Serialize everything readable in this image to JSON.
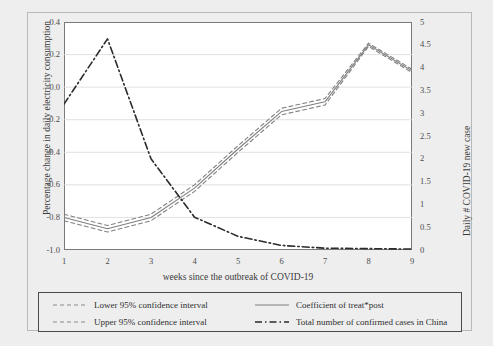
{
  "chart_data": {
    "type": "line",
    "title": "",
    "xlabel": "weeks since the outbreak of COVID-19",
    "ylabel": "Percentage change in daily electricity consumption",
    "y2label": "Daily # COVID-19 new case",
    "x": [
      1,
      2,
      3,
      4,
      5,
      6,
      7,
      8,
      9
    ],
    "xticklabels": [
      "1",
      "2",
      "3",
      "4",
      "5",
      "6",
      "7",
      "8",
      "9"
    ],
    "ylim": [
      -1.0,
      0.4
    ],
    "yticklabels": [
      "0.4",
      "0.2",
      "0.0",
      "-0.2",
      "-0.4",
      "-0.6",
      "-0.8",
      "-1.0"
    ],
    "yticks": [
      0.4,
      0.2,
      0.0,
      -0.2,
      -0.4,
      -0.6,
      -0.8,
      -1.0
    ],
    "y2lim": [
      0,
      5
    ],
    "y2ticklabels": [
      "5",
      "4.5",
      "4",
      "3.5",
      "3",
      "2.5",
      "2",
      "1.5",
      "1",
      "0.5",
      "0"
    ],
    "y2ticks": [
      5,
      4.5,
      4,
      3.5,
      3,
      2.5,
      2,
      1.5,
      1,
      0.5,
      0
    ],
    "grid": true,
    "legend_position": "below-plot",
    "series": [
      {
        "name": "Lower 95% confidence interval",
        "axis": "left",
        "style": "dashed",
        "color": "#808080",
        "values": [
          -0.82,
          -0.89,
          -0.82,
          -0.64,
          -0.4,
          -0.17,
          -0.11,
          0.25,
          0.09
        ]
      },
      {
        "name": "Upper 95% confidence interval",
        "axis": "left",
        "style": "dashed",
        "color": "#808080",
        "values": [
          -0.78,
          -0.85,
          -0.78,
          -0.6,
          -0.36,
          -0.13,
          -0.07,
          0.27,
          0.11
        ]
      },
      {
        "name": "Coefficient of treat*post",
        "axis": "left",
        "style": "solid",
        "color": "#7f7f7f",
        "values": [
          -0.8,
          -0.87,
          -0.8,
          -0.62,
          -0.38,
          -0.15,
          -0.09,
          0.26,
          0.1
        ]
      },
      {
        "name": "Total number of confirmed cases in China",
        "axis": "right",
        "style": "dash-dot",
        "color": "#2b2b2b",
        "values": [
          3.2,
          4.63,
          2.0,
          0.72,
          0.3,
          0.1,
          0.04,
          0.03,
          0.02
        ]
      }
    ]
  },
  "legend": {
    "items": [
      {
        "label": "Lower 95% confidence interval",
        "style": "dashed",
        "color": "#8a8a8a"
      },
      {
        "label": "Coefficient of treat*post",
        "style": "solid",
        "color": "#7f7f7f"
      },
      {
        "label": "Upper 95% confidence interval",
        "style": "dashed",
        "color": "#8a8a8a"
      },
      {
        "label": "Total number of confirmed cases in China",
        "style": "dash-dot",
        "color": "#2b2b2b"
      }
    ]
  }
}
